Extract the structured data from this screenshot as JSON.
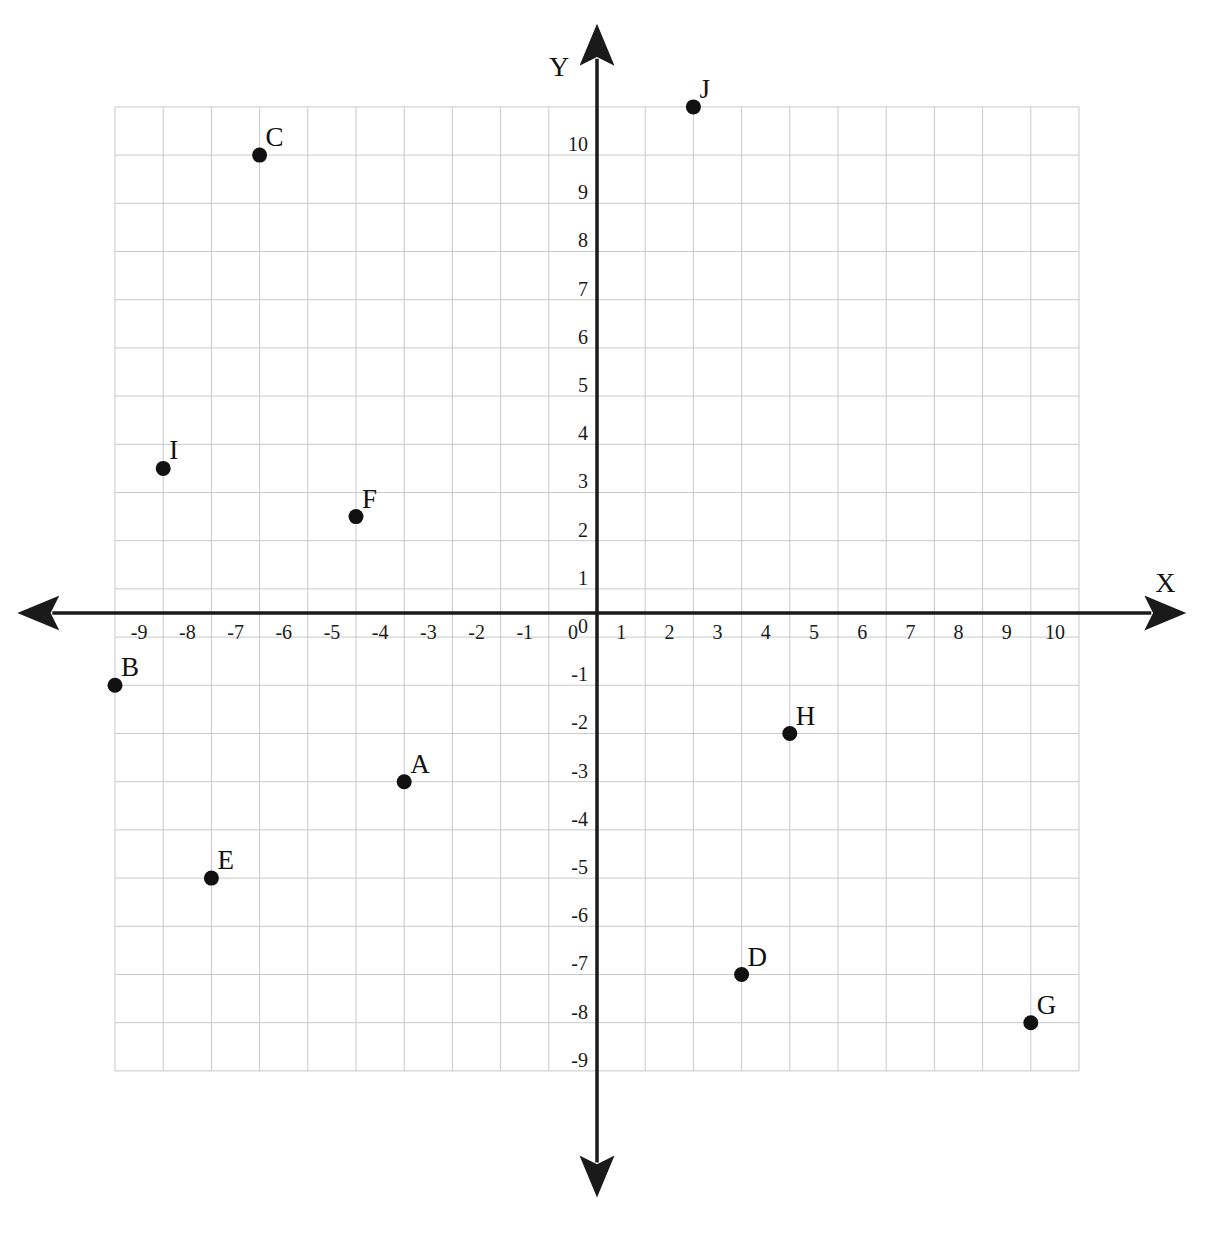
{
  "chart_data": {
    "type": "scatter",
    "title": "",
    "xlabel": "X",
    "ylabel": "Y",
    "xlim": [
      -10,
      10
    ],
    "ylim": [
      -9.5,
      10.5
    ],
    "grid": true,
    "legend": "none",
    "x_ticks": [
      "-9",
      "-8",
      "-7",
      "-6",
      "-5",
      "-4",
      "-3",
      "-2",
      "-1",
      "0",
      "1",
      "2",
      "3",
      "4",
      "5",
      "6",
      "7",
      "8",
      "9",
      "10"
    ],
    "x_tick_values": [
      -9,
      -8,
      -7,
      -6,
      -5,
      -4,
      -3,
      -2,
      -1,
      0,
      1,
      2,
      3,
      4,
      5,
      6,
      7,
      8,
      9,
      10
    ],
    "y_ticks": [
      "10",
      "9",
      "8",
      "7",
      "6",
      "5",
      "4",
      "3",
      "2",
      "1",
      "0",
      "-1",
      "-2",
      "-3",
      "-4",
      "-5",
      "-6",
      "-7",
      "-8",
      "-9"
    ],
    "y_tick_values": [
      10,
      9,
      8,
      7,
      6,
      5,
      4,
      3,
      2,
      1,
      0,
      -1,
      -2,
      -3,
      -4,
      -5,
      -6,
      -7,
      -8,
      -9
    ],
    "point_color": "#111111",
    "grid_color": "#c9c9c9",
    "axis_color": "#1a1a1a",
    "points": [
      {
        "label": "A",
        "x": -4,
        "y": -3.5
      },
      {
        "label": "B",
        "x": -10,
        "y": -1.5
      },
      {
        "label": "C",
        "x": -7,
        "y": 9.5
      },
      {
        "label": "D",
        "x": 3,
        "y": -7.5
      },
      {
        "label": "E",
        "x": -8,
        "y": -5.5
      },
      {
        "label": "F",
        "x": -5,
        "y": 2
      },
      {
        "label": "G",
        "x": 9,
        "y": -8.5
      },
      {
        "label": "H",
        "x": 4,
        "y": -2.5
      },
      {
        "label": "I",
        "x": -9,
        "y": 3
      },
      {
        "label": "J",
        "x": 2,
        "y": 10.5
      }
    ]
  },
  "geometry": {
    "origin_x": 597,
    "origin_y": 613,
    "cell": 48.2,
    "grid_left": -10,
    "grid_right": 10,
    "grid_top": 10.5,
    "grid_bottom": -9.5,
    "axis_x_start": -11.3,
    "axis_x_end": 11.5,
    "axis_y_top": 11.5,
    "axis_y_bottom": -11.4,
    "point_radius": 7.5
  }
}
